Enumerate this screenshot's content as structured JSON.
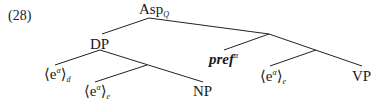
{
  "example_number": "(28)",
  "tree": {
    "root": {
      "label": "Asp",
      "subscript": "Q"
    },
    "left": {
      "label": "DP",
      "children": [
        {
          "label": "⟨e",
          "sup": "α",
          "close": "⟩",
          "subscript": "d"
        },
        {
          "label": "⟨e",
          "sup": "α",
          "close": "⟩",
          "subscript": "e"
        },
        {
          "label": "NP"
        }
      ]
    },
    "right": {
      "children": [
        {
          "label": "pref",
          "sup": "α",
          "style": "bold-italic"
        },
        {
          "label": "⟨e",
          "sup": "α",
          "close": "⟩",
          "subscript": "e"
        },
        {
          "label": "VP"
        }
      ]
    }
  },
  "line_color": "#222222"
}
